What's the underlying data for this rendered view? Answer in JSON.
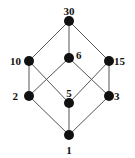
{
  "diagram": {
    "type": "hasse-diagram",
    "nodes": [
      {
        "id": "30",
        "label": "30"
      },
      {
        "id": "10",
        "label": "10"
      },
      {
        "id": "6",
        "label": "6"
      },
      {
        "id": "15",
        "label": "15"
      },
      {
        "id": "2",
        "label": "2"
      },
      {
        "id": "5",
        "label": "5"
      },
      {
        "id": "3",
        "label": "3"
      },
      {
        "id": "1",
        "label": "1"
      }
    ],
    "edges": [
      [
        "30",
        "10"
      ],
      [
        "30",
        "6"
      ],
      [
        "30",
        "15"
      ],
      [
        "10",
        "2"
      ],
      [
        "10",
        "5"
      ],
      [
        "6",
        "2"
      ],
      [
        "6",
        "3"
      ],
      [
        "15",
        "5"
      ],
      [
        "15",
        "3"
      ],
      [
        "2",
        "1"
      ],
      [
        "5",
        "1"
      ],
      [
        "3",
        "1"
      ]
    ],
    "colors": {
      "node": "#111111",
      "edge": "#555555"
    }
  }
}
